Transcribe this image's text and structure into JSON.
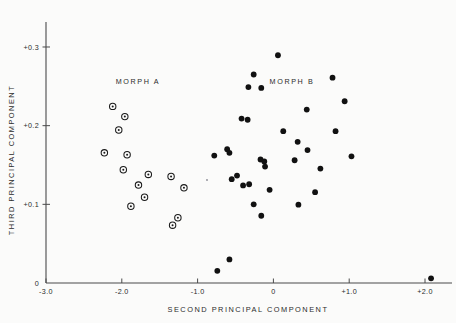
{
  "figure": {
    "background": "#fbfbfa",
    "ink": "#1a1a1a"
  },
  "chart_data": {
    "type": "scatter",
    "title": "",
    "xlabel": "SECOND PRINCIPAL COMPONENT",
    "ylabel": "THIRD PRINCIPAL COMPONENT",
    "xlim": [
      -3.0,
      2.2
    ],
    "ylim": [
      0,
      0.33
    ],
    "xticks": [
      -3.0,
      -2.0,
      -1.0,
      0,
      1.0,
      2.0
    ],
    "xticklabels": [
      "-3.0",
      "-2.0",
      "-1.0",
      "0",
      "+1.0",
      "+2.0"
    ],
    "yticks": [
      0,
      0.1,
      0.2,
      0.3
    ],
    "yticklabels": [
      "0",
      "+0.1",
      "+0.2",
      "+0.3"
    ],
    "grid": false,
    "legend": "inline-annotations",
    "annotations": [
      {
        "text": "MORPH A",
        "x": -2.08,
        "y": 0.253
      },
      {
        "text": "MORPH B",
        "x": -0.05,
        "y": 0.253
      }
    ],
    "series": [
      {
        "name": "MORPH A",
        "marker": "open-circle-with-dot",
        "color": "#1a1a1a",
        "points": [
          {
            "x": -2.12,
            "y": 0.2245
          },
          {
            "x": -1.96,
            "y": 0.2115
          },
          {
            "x": -2.04,
            "y": 0.1945
          },
          {
            "x": -2.23,
            "y": 0.1655
          },
          {
            "x": -1.93,
            "y": 0.163
          },
          {
            "x": -1.98,
            "y": 0.144
          },
          {
            "x": -1.65,
            "y": 0.138
          },
          {
            "x": -1.35,
            "y": 0.1355
          },
          {
            "x": -1.78,
            "y": 0.1245
          },
          {
            "x": -1.18,
            "y": 0.121
          },
          {
            "x": -1.7,
            "y": 0.109
          },
          {
            "x": -1.88,
            "y": 0.0975
          },
          {
            "x": -1.26,
            "y": 0.083
          },
          {
            "x": -1.33,
            "y": 0.0735
          }
        ]
      },
      {
        "name": "MORPH B",
        "marker": "filled-circle",
        "color": "#111111",
        "points": [
          {
            "x": 0.06,
            "y": 0.2895
          },
          {
            "x": -0.26,
            "y": 0.265
          },
          {
            "x": 0.78,
            "y": 0.261
          },
          {
            "x": -0.33,
            "y": 0.249
          },
          {
            "x": -0.16,
            "y": 0.248
          },
          {
            "x": 0.94,
            "y": 0.231
          },
          {
            "x": 0.44,
            "y": 0.2205
          },
          {
            "x": -0.42,
            "y": 0.209
          },
          {
            "x": -0.34,
            "y": 0.2075
          },
          {
            "x": 0.13,
            "y": 0.193
          },
          {
            "x": 0.82,
            "y": 0.193
          },
          {
            "x": 0.32,
            "y": 0.1795
          },
          {
            "x": -0.61,
            "y": 0.17
          },
          {
            "x": 0.45,
            "y": 0.169
          },
          {
            "x": -0.58,
            "y": 0.1655
          },
          {
            "x": -0.78,
            "y": 0.162
          },
          {
            "x": 1.03,
            "y": 0.161
          },
          {
            "x": -0.17,
            "y": 0.157
          },
          {
            "x": -0.12,
            "y": 0.1545
          },
          {
            "x": 0.28,
            "y": 0.156
          },
          {
            "x": -0.11,
            "y": 0.148
          },
          {
            "x": 0.62,
            "y": 0.1455
          },
          {
            "x": -0.48,
            "y": 0.1365
          },
          {
            "x": -0.55,
            "y": 0.132
          },
          {
            "x": -0.4,
            "y": 0.124
          },
          {
            "x": -0.32,
            "y": 0.1255
          },
          {
            "x": -0.05,
            "y": 0.1185
          },
          {
            "x": 0.55,
            "y": 0.1155
          },
          {
            "x": -0.26,
            "y": 0.1
          },
          {
            "x": 0.33,
            "y": 0.0995
          },
          {
            "x": -0.16,
            "y": 0.0855
          },
          {
            "x": -0.58,
            "y": 0.03
          },
          {
            "x": -0.74,
            "y": 0.0155
          },
          {
            "x": 2.08,
            "y": 0.006
          }
        ]
      }
    ]
  }
}
